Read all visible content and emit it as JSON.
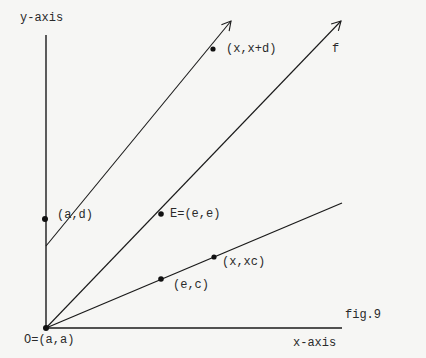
{
  "figure": {
    "caption": "fig.9",
    "axes": {
      "x_label": "x-axis",
      "y_label": "y-axis"
    },
    "lines": [
      {
        "name": "f",
        "label": "f",
        "from": "O",
        "direction": "slope 1"
      },
      {
        "name": "upper",
        "label": "",
        "from": "(a,d)",
        "direction": "slope 1"
      },
      {
        "name": "lower",
        "label": "",
        "from": "O",
        "direction": "slope c"
      }
    ],
    "points": {
      "origin": "O=(a,a)",
      "ad": "(a,d)",
      "xxd": "(x,x+d)",
      "E": "E=(e,e)",
      "ec": "(e,c)",
      "xxc": "(x,xc)"
    },
    "colors": {
      "ink": "#1a1a1a",
      "background": "#f6f6f4"
    }
  }
}
